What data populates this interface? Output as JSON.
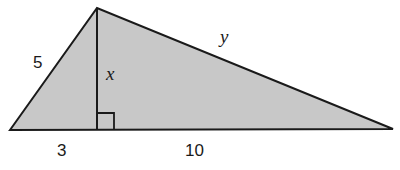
{
  "diagram": {
    "type": "right-triangle-altitude",
    "fill_color": "#c8c8c8",
    "stroke_color": "#1a1a1a",
    "vertices": {
      "left": [
        10,
        130
      ],
      "apex": [
        97,
        8
      ],
      "foot": [
        97,
        130
      ],
      "right": [
        393,
        129
      ]
    },
    "labels": {
      "left_side": "5",
      "altitude": "x",
      "hypotenuse_right": "y",
      "base_left_segment": "3",
      "base_right_segment": "10"
    },
    "right_angle_marker": true
  }
}
